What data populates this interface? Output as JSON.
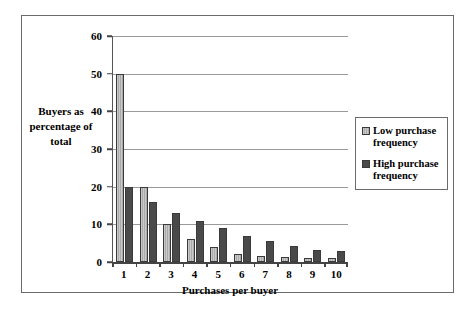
{
  "chart_data": {
    "type": "bar",
    "title": "",
    "xlabel": "Purchases per buyer",
    "ylabel": "Buyers as percentage of total",
    "categories": [
      "1",
      "2",
      "3",
      "4",
      "5",
      "6",
      "7",
      "8",
      "9",
      "10"
    ],
    "series": [
      {
        "name": "Low purchase frequency",
        "color": "#bfbfbf",
        "values": [
          50,
          20,
          10,
          6,
          4,
          2,
          1.5,
          1.2,
          1,
          1
        ]
      },
      {
        "name": "High purchase frequency",
        "color": "#4a4a4a",
        "values": [
          20,
          16,
          13,
          11,
          9,
          7,
          5.7,
          4.2,
          3.2,
          2.8
        ]
      }
    ],
    "ylim": [
      0,
      60
    ],
    "yticks": [
      0,
      10,
      20,
      30,
      40,
      50,
      60
    ],
    "ytick_labels": [
      "0",
      "10",
      "20",
      "30",
      "40",
      "50",
      "60"
    ],
    "grid": true,
    "legend_position": "right"
  },
  "axis": {
    "y_title_lines": [
      "Buyers as",
      "percentage of",
      "total"
    ],
    "x_title": "Purchases per buyer"
  },
  "legend": {
    "entries": [
      {
        "label_line1": "Low purchase",
        "label_line2": "frequency"
      },
      {
        "label_line1": "High purchase",
        "label_line2": "frequency"
      }
    ]
  }
}
